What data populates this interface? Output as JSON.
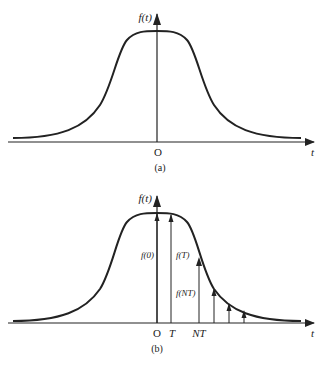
{
  "panel_a": {
    "y_label": "f(t)",
    "x_label": "t",
    "origin_label": "O",
    "caption": "(a)"
  },
  "panel_b": {
    "y_label": "f(t)",
    "x_label": "t",
    "tick_labels": [
      "O",
      "T",
      "NT"
    ],
    "impulse_labels": [
      "f(0)",
      "f(T)",
      "f(NT)"
    ],
    "caption": "(b)"
  },
  "colors": {
    "stroke": "#222222",
    "background": "#ffffff"
  }
}
